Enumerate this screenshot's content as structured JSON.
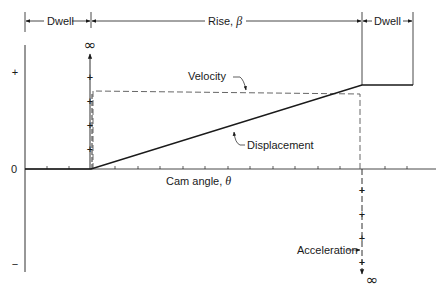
{
  "diagram": {
    "dimensions": {
      "dwell_left": "Dwell",
      "rise": "Rise, ",
      "rise_symbol": "β",
      "dwell_right": "Dwell"
    },
    "axis": {
      "x_label": "Cam angle, ",
      "x_symbol": "θ",
      "y_plus": "+",
      "y_zero": "0",
      "y_minus": "−"
    },
    "curves": {
      "velocity": "Velocity",
      "displacement": "Displacement",
      "acceleration": "Acceleration"
    },
    "infinity_top": "∞",
    "infinity_bottom": "∞",
    "colors": {
      "ink": "#1a1a1a",
      "dashed": "#555555",
      "background": "#ffffff"
    }
  }
}
